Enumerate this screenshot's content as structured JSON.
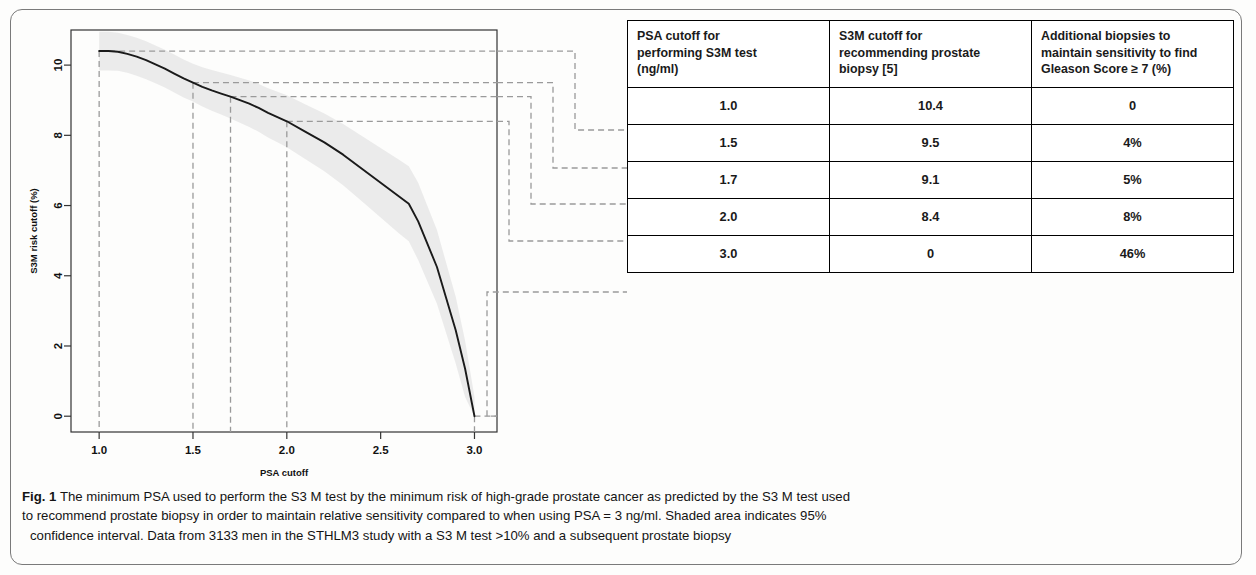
{
  "figure": {
    "number_label": "Fig. 1",
    "caption_line1": "The minimum PSA used to perform the S3 M test by the minimum risk of high-grade prostate cancer as predicted by the S3 M test used",
    "caption_line2": "to recommend prostate biopsy in order to maintain relative sensitivity compared to when using PSA = 3 ng/ml. Shaded area indicates 95%",
    "caption_line3": "confidence interval. Data from 3133 men in the STHLM3 study with a S3 M test >10% and a subsequent prostate biopsy"
  },
  "table": {
    "headers": [
      "PSA cutoff for performing S3M test (ng/ml)",
      "S3M cutoff for recommending prostate biopsy [5]",
      "Additional biopsies to maintain sensitivity to find Gleason Score ≥ 7 (%)"
    ],
    "header_lines": [
      [
        "PSA cutoff for",
        "performing S3M test",
        "(ng/ml)"
      ],
      [
        "S3M cutoff for",
        "recommending prostate",
        "biopsy [5]"
      ],
      [
        "Additional biopsies to",
        "maintain sensitivity to find",
        "Gleason Score ≥ 7 (%)"
      ]
    ],
    "rows": [
      [
        "1.0",
        "10.4",
        "0"
      ],
      [
        "1.5",
        "9.5",
        "4%"
      ],
      [
        "1.7",
        "9.1",
        "5%"
      ],
      [
        "2.0",
        "8.4",
        "8%"
      ],
      [
        "3.0",
        "0",
        "46%"
      ]
    ]
  },
  "chart_data": {
    "type": "line",
    "title": "",
    "xlabel": "PSA cutoff",
    "ylabel": "S3M risk cutoff (%)",
    "xlim": [
      0.85,
      3.12
    ],
    "ylim": [
      -0.45,
      11.0
    ],
    "xticks": [
      "1.0",
      "1.5",
      "2.0",
      "2.5",
      "3.0"
    ],
    "xtick_values": [
      1.0,
      1.5,
      2.0,
      2.5,
      3.0
    ],
    "yticks": [
      "0",
      "2",
      "4",
      "6",
      "8",
      "10"
    ],
    "ytick_values": [
      0,
      2,
      4,
      6,
      8,
      10
    ],
    "grid": false,
    "legend": "none",
    "series": [
      {
        "name": "S3M risk cutoff",
        "x": [
          1.0,
          1.05,
          1.1,
          1.15,
          1.2,
          1.25,
          1.3,
          1.35,
          1.4,
          1.45,
          1.5,
          1.55,
          1.6,
          1.65,
          1.7,
          1.75,
          1.8,
          1.85,
          1.9,
          1.95,
          2.0,
          2.1,
          2.2,
          2.3,
          2.4,
          2.5,
          2.6,
          2.65,
          2.7,
          2.8,
          2.9,
          2.95,
          3.0
        ],
        "y": [
          10.4,
          10.4,
          10.38,
          10.32,
          10.24,
          10.14,
          10.02,
          9.9,
          9.76,
          9.62,
          9.5,
          9.38,
          9.28,
          9.19,
          9.1,
          9.0,
          8.9,
          8.78,
          8.64,
          8.52,
          8.4,
          8.1,
          7.8,
          7.45,
          7.05,
          6.65,
          6.25,
          6.05,
          5.55,
          4.25,
          2.45,
          1.35,
          0.0
        ]
      }
    ],
    "confidence_band": {
      "label": "95% confidence interval",
      "upper": [
        10.95,
        10.95,
        10.92,
        10.86,
        10.78,
        10.68,
        10.56,
        10.44,
        10.3,
        10.16,
        10.04,
        9.94,
        9.86,
        9.79,
        9.72,
        9.64,
        9.56,
        9.46,
        9.34,
        9.24,
        9.14,
        8.88,
        8.62,
        8.32,
        7.98,
        7.64,
        7.3,
        7.12,
        6.65,
        5.3,
        3.4,
        2.15,
        0.55
      ],
      "lower": [
        9.85,
        9.85,
        9.84,
        9.78,
        9.7,
        9.6,
        9.48,
        9.36,
        9.22,
        9.08,
        8.96,
        8.82,
        8.7,
        8.59,
        8.48,
        8.36,
        8.24,
        8.1,
        7.94,
        7.8,
        7.66,
        7.32,
        6.98,
        6.58,
        6.12,
        5.66,
        5.2,
        4.98,
        4.45,
        3.2,
        1.5,
        0.55,
        0.0
      ]
    },
    "reference_markers": [
      {
        "x": 1.0,
        "y": 10.4,
        "label": "1.0"
      },
      {
        "x": 1.5,
        "y": 9.5,
        "label": "1.5"
      },
      {
        "x": 1.7,
        "y": 9.1,
        "label": "1.7"
      },
      {
        "x": 2.0,
        "y": 8.4,
        "label": "2.0"
      },
      {
        "x": 3.0,
        "y": 0.0,
        "label": "3.0"
      }
    ],
    "colors": {
      "line": "#1a1a1a",
      "band": "#e8e8e8",
      "guide": "#9a9a9a",
      "axis": "#333333"
    }
  }
}
